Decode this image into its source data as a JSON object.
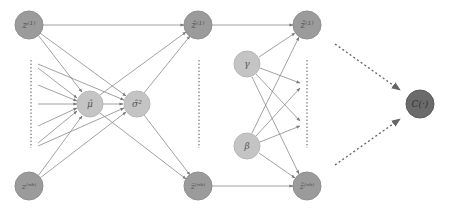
{
  "colors": {
    "input_node": "#9b9b9b",
    "stat_node": "#c4c4c4",
    "param_node": "#c4c4c4",
    "output_node": "#9b9b9b",
    "cost_node": "#6b6b6b",
    "edge": "#8a8a8a",
    "label": "#555555"
  },
  "nodes": {
    "z_1": {
      "label": "z⁽¹⁾",
      "x": 29,
      "y": 25
    },
    "z_nb": {
      "label": "z⁽ⁿᵇ⁾",
      "x": 29,
      "y": 186
    },
    "mu_hat": {
      "label": "μ̂",
      "x": 90,
      "y": 104
    },
    "sigma_hat_sq": {
      "label": "σ̂²",
      "x": 137,
      "y": 104
    },
    "z_hat_1": {
      "label": "ẑ⁽¹⁾",
      "x": 198,
      "y": 25
    },
    "z_hat_nb": {
      "label": "ẑ⁽ⁿᵇ⁾",
      "x": 198,
      "y": 186
    },
    "gamma": {
      "label": "γ",
      "x": 247,
      "y": 64
    },
    "beta": {
      "label": "β",
      "x": 247,
      "y": 146
    },
    "z_tilde_1": {
      "label": "z̃⁽¹⁾",
      "x": 307,
      "y": 25
    },
    "z_tilde_nb": {
      "label": "z̃⁽ⁿᵇ⁾",
      "x": 307,
      "y": 186
    },
    "cost": {
      "label": "C(·)",
      "x": 420,
      "y": 104
    }
  }
}
